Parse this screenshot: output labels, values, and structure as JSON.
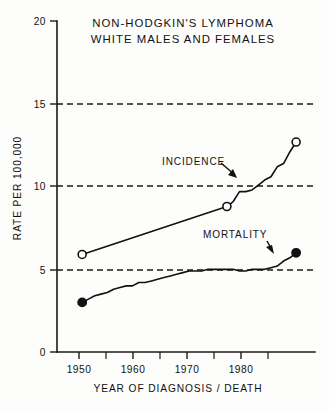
{
  "chart_data": {
    "type": "line",
    "title": "NON-HODGKIN'S LYMPHOMA WHITE MALES AND FEMALES",
    "title_line1": "NON-HODGKIN'S LYMPHOMA",
    "title_line2": "WHITE MALES AND FEMALES",
    "xlabel": "YEAR OF DIAGNOSIS / DEATH",
    "ylabel": "RATE PER 100,000",
    "xlim": [
      1946,
      1987
    ],
    "ylim": [
      0,
      20
    ],
    "grid": "horizontal dashed at 5, 10, 15",
    "legend": "inline annotations",
    "x_ticks_major": [
      1950,
      1960,
      1970,
      1980
    ],
    "x_tick_labels": [
      "1950",
      "1960",
      "1970",
      "1980"
    ],
    "x_ticks_minor": [
      1955,
      1965,
      1975,
      1985
    ],
    "y_ticks": [
      0,
      5,
      10,
      15,
      20
    ],
    "y_tick_labels": [
      "0",
      "5",
      "10",
      "15",
      "20"
    ],
    "gridlines_y": [
      5,
      10,
      15
    ],
    "series": [
      {
        "name": "INCIDENCE",
        "marker": "open-circle",
        "marker_years": [
          1950,
          1973,
          1984
        ],
        "x": [
          1950,
          1973,
          1974,
          1975,
          1976,
          1977,
          1978,
          1979,
          1980,
          1981,
          1982,
          1983,
          1984
        ],
        "values": [
          5.9,
          8.8,
          9.1,
          9.7,
          9.7,
          9.8,
          10.1,
          10.4,
          10.6,
          11.2,
          11.4,
          12.1,
          12.7
        ]
      },
      {
        "name": "MORTALITY",
        "marker": "filled-circle",
        "marker_years": [
          1950,
          1984
        ],
        "x": [
          1950,
          1951,
          1952,
          1953,
          1954,
          1955,
          1956,
          1957,
          1958,
          1959,
          1960,
          1961,
          1962,
          1963,
          1964,
          1965,
          1966,
          1967,
          1968,
          1969,
          1970,
          1971,
          1972,
          1973,
          1974,
          1975,
          1976,
          1977,
          1978,
          1979,
          1980,
          1981,
          1982,
          1983,
          1984
        ],
        "values": [
          3.0,
          3.2,
          3.4,
          3.5,
          3.6,
          3.8,
          3.9,
          4.0,
          4.0,
          4.2,
          4.2,
          4.3,
          4.4,
          4.5,
          4.6,
          4.7,
          4.8,
          4.9,
          4.9,
          4.9,
          5.0,
          5.0,
          5.0,
          5.0,
          5.0,
          4.9,
          4.9,
          5.0,
          5.0,
          5.0,
          5.1,
          5.2,
          5.5,
          5.7,
          6.0
        ]
      }
    ],
    "annotations": [
      {
        "text": "INCIDENCE",
        "target_series": "INCIDENCE"
      },
      {
        "text": "MORTALITY",
        "target_series": "MORTALITY"
      }
    ],
    "colors": {
      "ink": "#111111",
      "background": "#fdfdfb",
      "marker_open_fill": "#ffffff"
    }
  }
}
